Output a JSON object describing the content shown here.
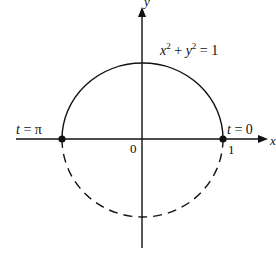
{
  "figure": {
    "type": "unit-circle-parametrization",
    "equation": {
      "x": "x",
      "exp1": "2",
      "plus": " + ",
      "y": "y",
      "exp2": "2",
      "eq": " = 1"
    },
    "axes": {
      "x_label": "x",
      "y_label": "y",
      "origin_label": "0",
      "tick_one_label": "1"
    },
    "points": [
      {
        "label_var": "t",
        "label_val": " = π",
        "x": -1,
        "y": 0
      },
      {
        "label_var": "t",
        "label_val": " = 0",
        "x": 1,
        "y": 0
      }
    ],
    "curves": [
      {
        "name": "upper-semicircle",
        "style": "solid"
      },
      {
        "name": "lower-semicircle",
        "style": "dashed"
      }
    ],
    "colors": {
      "ink": "#111111",
      "background": "#ffffff"
    }
  }
}
